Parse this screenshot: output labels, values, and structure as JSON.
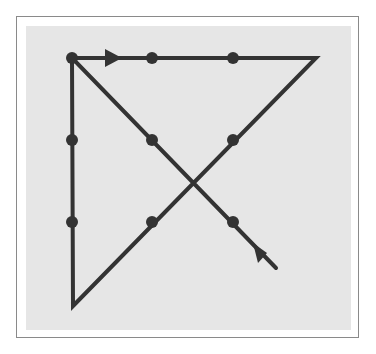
{
  "diagram": {
    "colors": {
      "background": "#ffffff",
      "frame_border": "#8a8a8a",
      "panel": "#e6e6e6",
      "ink": "#333333"
    },
    "dots": [
      {
        "id": "r1c1",
        "x": 72,
        "y": 58
      },
      {
        "id": "r1c2",
        "x": 152,
        "y": 58
      },
      {
        "id": "r1c3",
        "x": 233,
        "y": 58
      },
      {
        "id": "r2c1",
        "x": 72,
        "y": 140
      },
      {
        "id": "r2c2",
        "x": 152,
        "y": 140
      },
      {
        "id": "r2c3",
        "x": 233,
        "y": 140
      },
      {
        "id": "r3c1",
        "x": 72,
        "y": 222
      },
      {
        "id": "r3c2",
        "x": 152,
        "y": 222
      },
      {
        "id": "r3c3",
        "x": 233,
        "y": 222
      }
    ],
    "path": [
      {
        "x": 276,
        "y": 268
      },
      {
        "x": 72,
        "y": 58
      },
      {
        "x": 316,
        "y": 58
      },
      {
        "x": 73,
        "y": 306
      },
      {
        "x": 72,
        "y": 58
      }
    ],
    "arrows": [
      {
        "name": "start-arrow",
        "points": "105,49 122,58 105,67"
      },
      {
        "name": "end-arrow",
        "points": "253,243 267,253 258,263"
      }
    ],
    "segments_count": 4
  }
}
